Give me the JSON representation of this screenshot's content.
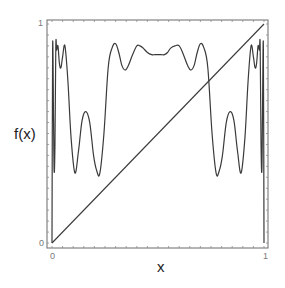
{
  "chart_data": {
    "type": "line",
    "title": "",
    "xlabel": "x",
    "ylabel": "f(x)",
    "xlim": [
      0,
      1
    ],
    "ylim": [
      0,
      1
    ],
    "grid": false,
    "legend": null,
    "x_ticks": [
      "0",
      "1"
    ],
    "y_ticks": [
      "0",
      "1"
    ],
    "series": [
      {
        "name": "f(x)",
        "x": [
          0.0,
          0.003,
          0.007,
          0.01,
          0.014,
          0.018,
          0.022,
          0.028,
          0.035,
          0.042,
          0.05,
          0.061,
          0.075,
          0.09,
          0.108,
          0.125,
          0.142,
          0.16,
          0.178,
          0.196,
          0.211,
          0.226,
          0.245,
          0.265,
          0.283,
          0.3,
          0.315,
          0.33,
          0.345,
          0.36,
          0.38,
          0.4,
          0.415,
          0.43,
          0.45,
          0.47,
          0.485,
          0.5,
          0.515,
          0.53,
          0.545,
          0.56,
          0.58,
          0.6,
          0.62,
          0.64,
          0.655,
          0.67,
          0.685,
          0.7,
          0.717,
          0.735,
          0.755,
          0.774,
          0.789,
          0.804,
          0.822,
          0.84,
          0.858,
          0.875,
          0.892,
          0.91,
          0.925,
          0.939,
          0.95,
          0.958,
          0.965,
          0.972,
          0.978,
          0.982,
          0.986,
          0.99,
          0.993,
          0.997,
          1.0
        ],
        "values": [
          0.0,
          0.9,
          0.6,
          0.33,
          0.45,
          0.9,
          0.88,
          0.9,
          0.82,
          0.8,
          0.85,
          0.9,
          0.74,
          0.48,
          0.32,
          0.42,
          0.56,
          0.6,
          0.55,
          0.4,
          0.33,
          0.32,
          0.5,
          0.8,
          0.89,
          0.91,
          0.87,
          0.81,
          0.79,
          0.81,
          0.86,
          0.9,
          0.9,
          0.89,
          0.87,
          0.86,
          0.86,
          0.86,
          0.86,
          0.86,
          0.87,
          0.89,
          0.9,
          0.9,
          0.86,
          0.81,
          0.79,
          0.81,
          0.87,
          0.91,
          0.89,
          0.8,
          0.5,
          0.32,
          0.33,
          0.4,
          0.55,
          0.6,
          0.56,
          0.42,
          0.32,
          0.48,
          0.74,
          0.9,
          0.85,
          0.8,
          0.82,
          0.9,
          0.88,
          0.9,
          0.45,
          0.33,
          0.6,
          0.9,
          0.0
        ]
      },
      {
        "name": "y = x",
        "x": [
          0,
          1
        ],
        "values": [
          0,
          1
        ]
      }
    ]
  },
  "labels": {
    "ylabel": "f(x)",
    "xlabel": "x",
    "x_tick_0": "0",
    "x_tick_1": "1",
    "y_tick_0": "0",
    "y_tick_1": "1"
  },
  "colors": {
    "curve": "#3a3a3a",
    "frame": "#6a6a6a",
    "tick_label": "#7a7a7a"
  }
}
